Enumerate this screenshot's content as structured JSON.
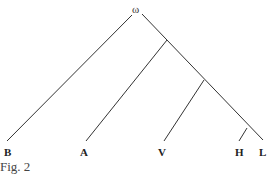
{
  "figure": {
    "caption": "Fig. 2",
    "root_label": "ω",
    "leaves": [
      "B",
      "A",
      "V",
      "H",
      "L"
    ],
    "edges": [
      {
        "from": "ω",
        "to": "B"
      },
      {
        "from": "ω",
        "to": "n1"
      },
      {
        "from": "n1",
        "to": "A"
      },
      {
        "from": "n1",
        "to": "n2"
      },
      {
        "from": "n2",
        "to": "V"
      },
      {
        "from": "n2",
        "to": "n3"
      },
      {
        "from": "n3",
        "to": "H"
      },
      {
        "from": "n3",
        "to": "L"
      }
    ],
    "line_color": "#333333"
  }
}
